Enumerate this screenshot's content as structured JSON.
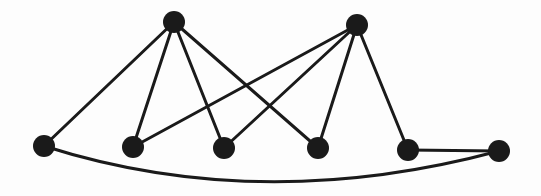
{
  "diagram": {
    "type": "graph",
    "background": "#fdfdfd",
    "edge_color": "#1a1a1a",
    "node_color": "#1a1a1a",
    "node_radius": 11,
    "edge_width": 3,
    "nodes": [
      {
        "id": "T1",
        "x": 174,
        "y": 22
      },
      {
        "id": "T2",
        "x": 357,
        "y": 25
      },
      {
        "id": "B1",
        "x": 44,
        "y": 146
      },
      {
        "id": "B2",
        "x": 133,
        "y": 147
      },
      {
        "id": "B3",
        "x": 224,
        "y": 148
      },
      {
        "id": "B4",
        "x": 318,
        "y": 148
      },
      {
        "id": "B5",
        "x": 408,
        "y": 150
      },
      {
        "id": "B6",
        "x": 499,
        "y": 151
      }
    ],
    "edges": [
      {
        "from": "T1",
        "to": "B1"
      },
      {
        "from": "T1",
        "to": "B2"
      },
      {
        "from": "T1",
        "to": "B3"
      },
      {
        "from": "T1",
        "to": "B4"
      },
      {
        "from": "T2",
        "to": "B2"
      },
      {
        "from": "T2",
        "to": "B3"
      },
      {
        "from": "T2",
        "to": "B4"
      },
      {
        "from": "T2",
        "to": "B5"
      },
      {
        "from": "B5",
        "to": "B6"
      },
      {
        "from": "B1",
        "to": "B6",
        "curved": true,
        "control": {
          "x": 260,
          "y": 215
        }
      }
    ]
  }
}
